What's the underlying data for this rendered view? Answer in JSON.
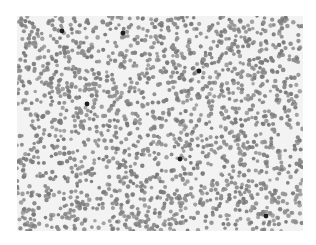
{
  "image": {
    "subject": "microscope blood smear",
    "description": "Grayscale micrograph of densely packed red blood cells with a few darkly stained leukocytes",
    "colors": {
      "background": "#f3f3f3",
      "rbc": "#8e8e8e",
      "rbc_dark": "#7a7a7a",
      "leukocyte": "#1e1e1e"
    },
    "dark_cells": [
      {
        "x": 45,
        "y": 15
      },
      {
        "x": 106,
        "y": 17
      },
      {
        "x": 182,
        "y": 55
      },
      {
        "x": 70,
        "y": 88
      },
      {
        "x": 163,
        "y": 143
      },
      {
        "x": 249,
        "y": 200
      }
    ]
  }
}
